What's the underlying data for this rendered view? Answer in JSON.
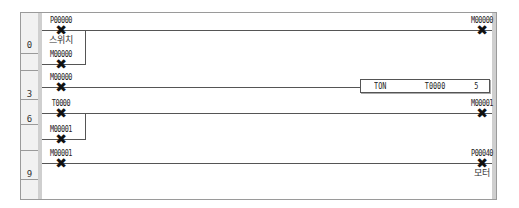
{
  "ladder": {
    "steps": [
      {
        "label": "0"
      },
      {
        "label": "3"
      },
      {
        "label": "6"
      },
      {
        "label": "9"
      }
    ],
    "rungs": [
      {
        "step": "0",
        "contacts": [
          {
            "address": "P00000",
            "comment": "스위치",
            "type": "contact"
          },
          {
            "address": "M00000",
            "comment": "",
            "type": "contact-parallel"
          }
        ],
        "coil": {
          "address": "M00000",
          "comment": ""
        }
      },
      {
        "step": "3",
        "contacts": [
          {
            "address": "M00000",
            "comment": "",
            "type": "contact"
          }
        ],
        "function_block": {
          "instruction": "TON",
          "operand": "T0000",
          "preset": "5"
        }
      },
      {
        "step": "6",
        "contacts": [
          {
            "address": "T0000",
            "comment": "",
            "type": "contact"
          },
          {
            "address": "M00001",
            "comment": "",
            "type": "contact-parallel"
          }
        ],
        "coil": {
          "address": "M00001",
          "comment": ""
        }
      },
      {
        "step": "9",
        "contacts": [
          {
            "address": "M00001",
            "comment": "",
            "type": "contact"
          }
        ],
        "coil": {
          "address": "P00040",
          "comment": "모터"
        }
      }
    ],
    "symbols": {
      "contact_mark": "✖",
      "coil_mark": "✖"
    },
    "colors": {
      "wire": "#555555",
      "rail": "#cfcfcf",
      "gutter": "#f1f1f1",
      "border": "#9a9a9a"
    }
  }
}
